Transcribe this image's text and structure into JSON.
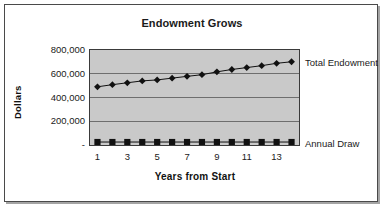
{
  "chart": {
    "title": "Endowment Grows",
    "y_axis_title": "Dollars",
    "x_axis_title": "Years from Start",
    "series_labels": {
      "total": "Total Endowment",
      "draw": "Annual Draw"
    },
    "y_ticks": [
      "800,000",
      "600,000",
      "400,000",
      "200,000",
      "-"
    ],
    "x_ticks": [
      "1",
      "3",
      "5",
      "7",
      "9",
      "11",
      "13"
    ],
    "colors": {
      "plot_background": "#c9c9c9",
      "gridline": "#6e6e6e",
      "axis": "#3a3a3a",
      "series": "#111111",
      "frame": "#4a4a4a",
      "page_background": "#ffffff"
    }
  },
  "chart_data": {
    "type": "line",
    "title": "Endowment Grows",
    "xlabel": "Years from Start",
    "ylabel": "Dollars",
    "x": [
      1,
      2,
      3,
      4,
      5,
      6,
      7,
      8,
      9,
      10,
      11,
      12,
      13,
      14
    ],
    "xlim": [
      0.5,
      14.5
    ],
    "ylim": [
      0,
      800000
    ],
    "ytick_values": [
      0,
      200000,
      400000,
      600000,
      800000
    ],
    "ytick_labels": [
      "-",
      "200,000",
      "400,000",
      "600,000",
      "800,000"
    ],
    "xtick_labels": [
      "1",
      "3",
      "5",
      "7",
      "9",
      "11",
      "13"
    ],
    "grid": true,
    "legend": "right-of-plot-inline-labels",
    "series": [
      {
        "name": "Total Endowment",
        "marker": "diamond",
        "values": [
          490000,
          508000,
          524000,
          540000,
          548000,
          563000,
          578000,
          592000,
          616000,
          636000,
          652000,
          668000,
          688000,
          701000
        ]
      },
      {
        "name": "Annual Draw",
        "marker": "square",
        "values": [
          25000,
          25000,
          25000,
          25000,
          25000,
          25000,
          25000,
          25000,
          25000,
          25000,
          25000,
          25000,
          25000,
          25000
        ]
      }
    ]
  }
}
